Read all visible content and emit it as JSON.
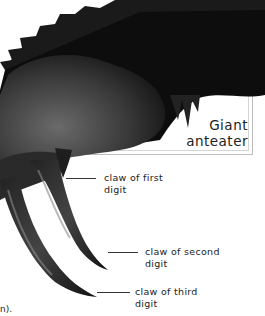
{
  "figure": {
    "title_line1": "Giant",
    "title_line2": "anteater",
    "labels": [
      {
        "line1": "claw of first",
        "line2": "digit"
      },
      {
        "line1": "claw of second",
        "line2": "digit"
      },
      {
        "line1": "claw of third",
        "line2": "digit"
      }
    ],
    "cropped_text_fragment": "n)."
  },
  "colors": {
    "frame_border": "#bdbdbd",
    "text": "#222222",
    "fur_dark": "#111111",
    "fur_mid": "#555555"
  }
}
